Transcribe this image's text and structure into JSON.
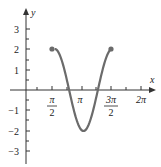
{
  "chart_data": {
    "type": "line",
    "title": "",
    "xlabel": "x",
    "ylabel": "y",
    "function": "y = -2cos(2x), π/2 ≤ x ≤ 3π/2",
    "xlim": [
      0,
      6.6
    ],
    "ylim": [
      -3.5,
      3.5
    ],
    "x_ticks": [
      "π/2",
      "π",
      "3π/2",
      "2π"
    ],
    "y_ticks": [
      "3",
      "2",
      "1",
      "−1",
      "−2",
      "−3"
    ],
    "grid": false,
    "endpoints": [
      {
        "x": "π/2",
        "y": 2,
        "closed": true
      },
      {
        "x": "3π/2",
        "y": 2,
        "closed": true
      }
    ],
    "series": [
      {
        "name": "y = -2cos(2x)",
        "color": "#6b6b6b",
        "x": [
          1.5708,
          1.9635,
          2.3562,
          2.7489,
          3.1416,
          3.5343,
          3.927,
          4.3197,
          4.7124
        ],
        "y": [
          2,
          1.414,
          0,
          -1.414,
          -2,
          -1.414,
          0,
          1.414,
          2
        ]
      }
    ]
  },
  "labels": {
    "x_axis": "x",
    "y_axis": "y",
    "ticks_x": {
      "pi_over_2_num": "π",
      "pi_over_2_den": "2",
      "pi": "π",
      "three_pi_over_2_num": "3π",
      "three_pi_over_2_den": "2",
      "two_pi": "2π"
    },
    "ticks_y": {
      "p3": "3",
      "p2": "2",
      "p1": "1",
      "n1": "−1",
      "n2": "−2",
      "n3": "−3"
    }
  }
}
